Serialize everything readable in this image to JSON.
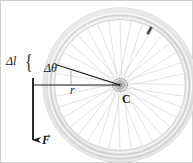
{
  "figure": {
    "border_color": "#cccccc",
    "background": "#ffffff"
  },
  "labels": {
    "arc_length": "Δl",
    "brace": "{",
    "angle": "Δθ",
    "radius": "r",
    "center": "C",
    "force": "F",
    "force_vector_arrow": "→"
  },
  "colors": {
    "tire_outer": "#d8d8d8",
    "tire_inner": "#f2f2f2",
    "rim": "#e6e6e6",
    "spoke": "#c9c9c9",
    "hub": "#b5b5b5",
    "line_dark": "#1a1a1a",
    "line_gray": "#555555"
  },
  "geometry": {
    "center_x": 120,
    "center_y": 85,
    "tire_outer_radius": 77,
    "tire_inner_radius": 69,
    "rim_radius": 66,
    "hub_radius": 6,
    "spoke_count": 36,
    "arc_point_angle_deg": 196,
    "force_line_x": 33,
    "force_line_y_top": 78,
    "force_line_y_bottom": 147,
    "valve_x": 148,
    "valve_y": 30
  }
}
